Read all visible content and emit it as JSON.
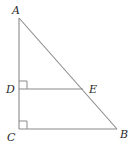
{
  "diagram": {
    "type": "geometry",
    "points": {
      "A": {
        "label": "A"
      },
      "B": {
        "label": "B"
      },
      "C": {
        "label": "C"
      },
      "D": {
        "label": "D"
      },
      "E": {
        "label": "E"
      }
    },
    "segments": [
      {
        "from": "A",
        "to": "C"
      },
      {
        "from": "A",
        "to": "B"
      },
      {
        "from": "C",
        "to": "B"
      },
      {
        "from": "D",
        "to": "E"
      }
    ],
    "right_angles": [
      "D",
      "C"
    ],
    "colors": {
      "stroke": "#8a8a8a",
      "label": "#2a2a2a"
    }
  }
}
